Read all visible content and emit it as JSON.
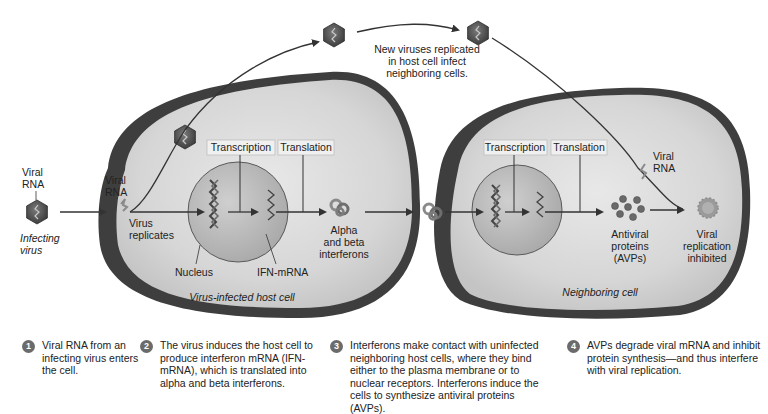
{
  "diagram": {
    "infecting_virus": {
      "rna_label_line1": "Viral",
      "rna_label_line2": "RNA",
      "caption_line1": "Infecting",
      "caption_line2": "virus"
    },
    "host_cell": {
      "name": "Virus-infected host cell",
      "viral_rna_line1": "Viral",
      "viral_rna_line2": "RNA",
      "replicates_line1": "Virus",
      "replicates_line2": "replicates",
      "transcription_label": "Transcription",
      "translation_label": "Translation",
      "nucleus_label": "Nucleus",
      "mrna_label": "IFN-mRNA",
      "interferons_line1": "Alpha",
      "interferons_line2": "and beta",
      "interferons_line3": "interferons"
    },
    "new_viruses": {
      "line1": "New viruses replicated",
      "line2": "in host cell infect",
      "line3": "neighboring cells."
    },
    "neighbor_cell": {
      "name": "Neighboring cell",
      "transcription_label": "Transcription",
      "translation_label": "Translation",
      "viral_rna_line1": "Viral",
      "viral_rna_line2": "RNA",
      "avp_line1": "Antiviral",
      "avp_line2": "proteins",
      "avp_line3": "(AVPs)",
      "inhibited_line1": "Viral",
      "inhibited_line2": "replication",
      "inhibited_line3": "inhibited"
    },
    "colors": {
      "cell_membrane": "#3a3a3a",
      "cytoplasm": "#d9d9d9",
      "nucleus": "#bdbdbd",
      "virus": "#555555",
      "step_badge": "#6b6b6b",
      "arrow": "#333333"
    }
  },
  "steps": [
    {
      "number": "1",
      "text": "Viral RNA from an infecting virus enters the cell."
    },
    {
      "number": "2",
      "text": "The virus induces the host cell to produce interferon mRNA (IFN-mRNA), which is translated into alpha and beta interferons."
    },
    {
      "number": "3",
      "text": "Interferons make contact with uninfected neighboring host cells, where they bind either to the plasma membrane or to nuclear receptors. Interferons induce the cells to synthesize antiviral proteins (AVPs)."
    },
    {
      "number": "4",
      "text": "AVPs degrade viral mRNA and inhibit protein synthesis—and thus interfere with viral replication."
    }
  ]
}
